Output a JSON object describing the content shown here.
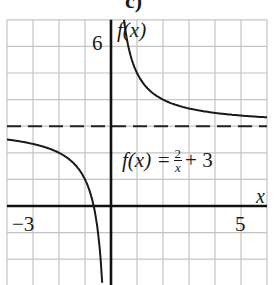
{
  "figure": {
    "part_label": "c)",
    "equation": {
      "lhs": "f(x) =",
      "numerator": "2",
      "denominator": "x",
      "rhs": "+ 3"
    },
    "y_axis_label": "f(x)",
    "x_axis_label": "x",
    "tick_labels": {
      "y_top": "6",
      "x_left": "−3",
      "x_right": "5"
    }
  },
  "chart_data": {
    "type": "line",
    "title": "c)",
    "function": "f(x) = 2/x + 3",
    "xlabel": "x",
    "ylabel": "f(x)",
    "xlim": [
      -4,
      6
    ],
    "ylim": [
      -3,
      7
    ],
    "grid": true,
    "grid_step": 1,
    "labeled_ticks": {
      "x": [
        -3,
        5
      ],
      "y": [
        6
      ]
    },
    "asymptotes": {
      "horizontal": {
        "y": 3,
        "style": "dashed"
      },
      "vertical": {
        "x": 0
      }
    },
    "series": [
      {
        "name": "right branch",
        "x": [
          0.5,
          0.75,
          1,
          1.5,
          2,
          3,
          4,
          5,
          6
        ],
        "y": [
          7,
          5.67,
          5,
          4.33,
          4,
          3.67,
          3.5,
          3.4,
          3.33
        ]
      },
      {
        "name": "left branch",
        "x": [
          -4,
          -3,
          -2,
          -1.5,
          -1,
          -0.75,
          -0.5
        ],
        "y": [
          2.5,
          2.33,
          2,
          1.67,
          1,
          0.33,
          -1
        ]
      }
    ],
    "colors": {
      "curve": "#1a1a1a",
      "grid": "#bdbdbd",
      "axis": "#111111"
    }
  }
}
